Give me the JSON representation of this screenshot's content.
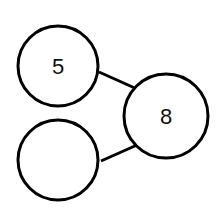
{
  "diagram": {
    "type": "number-bond",
    "parts": [
      {
        "id": "part-a",
        "value": "5"
      },
      {
        "id": "part-b",
        "value": ""
      }
    ],
    "whole": {
      "id": "whole",
      "value": "8"
    },
    "stroke_color": "#000000",
    "fill_color": "#ffffff"
  }
}
